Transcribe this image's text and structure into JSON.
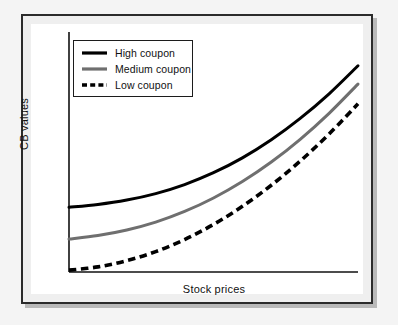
{
  "figure": {
    "background_color": "#f4f4f4",
    "frame_color": "#2b2b2b",
    "panel_color": "#ffffff"
  },
  "axes": {
    "y_title": "CB values",
    "x_title": "Stock prices",
    "axis_color": "#111111"
  },
  "legend": {
    "items": [
      {
        "label": "High coupon",
        "style": "solid",
        "color": "#000000",
        "swatch_name": "legend-swatch-high-coupon"
      },
      {
        "label": "Medium coupon",
        "style": "solid",
        "color": "#6f6f6f",
        "swatch_name": "legend-swatch-medium-coupon"
      },
      {
        "label": "Low coupon",
        "style": "dashed",
        "color": "#000000",
        "swatch_name": "legend-swatch-low-coupon"
      }
    ]
  },
  "chart_data": {
    "type": "line",
    "title": "",
    "subtitle": "",
    "xlabel": "Stock prices",
    "ylabel": "CB values",
    "xlim": [
      0,
      1
    ],
    "ylim": [
      0,
      1
    ],
    "grid": false,
    "legend_position": "upper-left",
    "annotations": [],
    "xticks": [],
    "yticks": [],
    "x": [
      0,
      0.1,
      0.2,
      0.3,
      0.4,
      0.5,
      0.6,
      0.7,
      0.8,
      0.9,
      1.0
    ],
    "series": [
      {
        "name": "High coupon",
        "color": "#000000",
        "style": "solid",
        "width": 3,
        "values": [
          0.279,
          0.291,
          0.31,
          0.338,
          0.377,
          0.428,
          0.492,
          0.57,
          0.662,
          0.768,
          0.889
        ]
      },
      {
        "name": "Medium coupon",
        "color": "#6f6f6f",
        "style": "solid",
        "width": 3,
        "values": [
          0.142,
          0.157,
          0.181,
          0.215,
          0.261,
          0.319,
          0.39,
          0.474,
          0.572,
          0.684,
          0.81
        ]
      },
      {
        "name": "Low coupon",
        "color": "#000000",
        "style": "dashed",
        "width": 3.6,
        "values": [
          0.008,
          0.022,
          0.049,
          0.088,
          0.14,
          0.205,
          0.283,
          0.374,
          0.478,
          0.595,
          0.725
        ]
      }
    ]
  }
}
